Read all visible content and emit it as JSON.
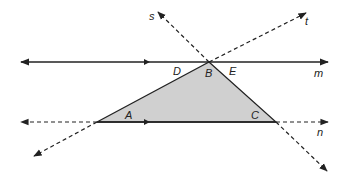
{
  "diagram": {
    "colors": {
      "line": "#222222",
      "fill": "#d0d0d0"
    },
    "points": {
      "A": {
        "label": "A",
        "x": 97,
        "y": 122
      },
      "B": {
        "label": "B",
        "x": 209,
        "y": 62
      },
      "C": {
        "label": "C",
        "x": 276,
        "y": 122
      }
    },
    "labels": {
      "s": "s",
      "t": "t",
      "m": "m",
      "n": "n",
      "D": "D",
      "B": "B",
      "E": "E",
      "A": "A",
      "C": "C"
    }
  }
}
